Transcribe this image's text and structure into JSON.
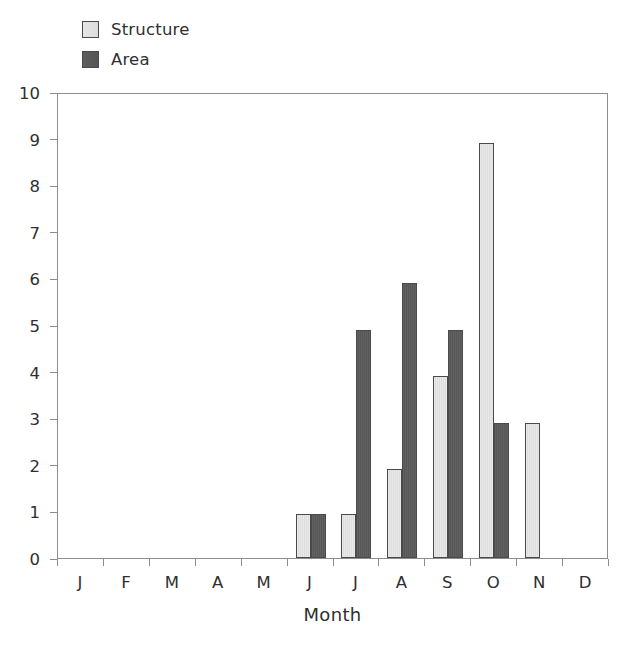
{
  "chart_data": {
    "type": "bar",
    "title": "",
    "xlabel": "Month",
    "ylabel": "",
    "ylim": [
      0,
      10
    ],
    "yticks": [
      0,
      1,
      2,
      3,
      4,
      5,
      6,
      7,
      8,
      9,
      10
    ],
    "ytick_labels": [
      "0",
      "1",
      "2",
      "3",
      "4",
      "5",
      "6",
      "7",
      "8",
      "9",
      "10"
    ],
    "grid": false,
    "legend_position": "top-left",
    "categories": [
      "J",
      "F",
      "M",
      "A",
      "M",
      "J",
      "J",
      "A",
      "S",
      "O",
      "N",
      "D"
    ],
    "series": [
      {
        "name": "Structure",
        "color": "#dedede",
        "border_color": "#4a4a4a",
        "values": [
          0,
          0,
          0,
          0,
          0,
          0.95,
          0.95,
          1.9,
          3.9,
          8.9,
          2.9,
          0
        ]
      },
      {
        "name": "Area",
        "color": "#5a5a5a",
        "border_color": "#4a4a4a",
        "values": [
          0,
          0,
          0,
          0,
          0,
          0.95,
          4.9,
          5.9,
          4.9,
          2.9,
          0,
          0
        ]
      }
    ]
  },
  "legend": {
    "items": [
      {
        "label": "Structure",
        "swatch": "structure-swatch"
      },
      {
        "label": "Area",
        "swatch": "area-swatch"
      }
    ]
  },
  "axes": {
    "x_title": "Month"
  }
}
